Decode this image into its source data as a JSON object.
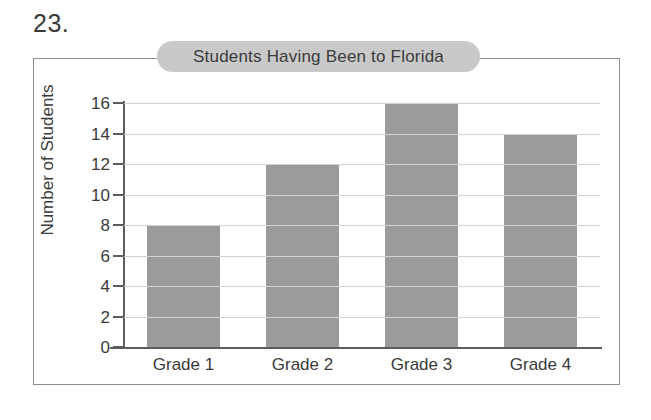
{
  "problem": {
    "number": "23."
  },
  "chart_data": {
    "type": "bar",
    "title": "Students Having Been to Florida",
    "xlabel": "",
    "ylabel": "Number of Students",
    "categories": [
      "Grade 1",
      "Grade 2",
      "Grade 3",
      "Grade 4"
    ],
    "values": [
      8,
      12,
      16,
      14
    ],
    "ylim": [
      0,
      16
    ],
    "ytick_labels": [
      "16",
      "14",
      "12",
      "10",
      "8",
      "6",
      "4",
      "2",
      "0"
    ],
    "ytick_values": [
      16,
      14,
      12,
      10,
      8,
      6,
      4,
      2,
      0
    ],
    "grid": true,
    "legend": false,
    "series": [
      {
        "name": "Number of Students",
        "values": [
          8,
          12,
          16,
          14
        ]
      }
    ]
  },
  "style": {
    "bar_color": "#9b9b9b",
    "title_pill_color": "#c9c9c9",
    "gridline_color": "#d2d2d2",
    "axis_color": "#5d5d5d",
    "frame_color": "#8e8e8e",
    "text_color": "#3a3a3a",
    "background": "#ffffff"
  }
}
